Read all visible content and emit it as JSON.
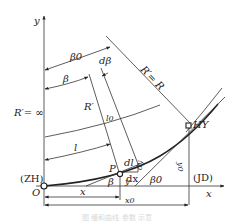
{
  "diagram": {
    "axes": {
      "x_label": "x",
      "y_label": "y",
      "origin_label": "O"
    },
    "points": {
      "start": "(ZH)",
      "end": "HY",
      "intersection": "(JD)",
      "point": "P"
    },
    "angles": {
      "beta0_top": "β0",
      "beta": "β",
      "dbeta": "dβ",
      "beta_at_p": "β",
      "beta0_bottom": "β0"
    },
    "radii": {
      "r_infinite": "R′= ∞",
      "r_prime": "R′",
      "r_equal": "R′= R"
    },
    "lengths": {
      "l0": "l0",
      "l": "l",
      "dl": "dl",
      "dx": "dx",
      "dy": "dy",
      "x": "x",
      "x0": "x0",
      "y": "y",
      "y0": "y0"
    },
    "caption": "图 缓和曲线 参数 示意"
  }
}
